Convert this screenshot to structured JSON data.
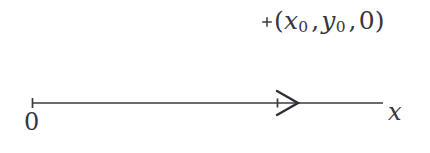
{
  "figure": {
    "type": "coordinate-axis-diagram",
    "background_color": "#ffffff",
    "ink_color": "#3a3a42"
  },
  "point_annotation": {
    "marker_glyph": "plus-marker",
    "label_open_paren": "(",
    "x_symbol": "x",
    "x_subscript": "0",
    "comma_1": ",",
    "y_symbol": "y",
    "y_subscript": "0",
    "comma_2": ",",
    "z_value": "0",
    "label_close_paren": ")",
    "full_label": "(x0 , y0 , 0)"
  },
  "axis": {
    "origin_label": "0",
    "name_label": "x",
    "direction": "right",
    "line_start_x": 32,
    "line_end_x": 383,
    "line_y": 103,
    "arrowhead_x": 288,
    "start_tick": true
  }
}
